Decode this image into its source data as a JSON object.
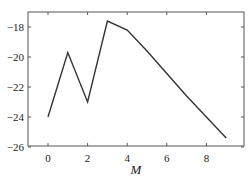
{
  "chart_data": {
    "type": "line",
    "title": "",
    "xlabel": "M",
    "ylabel": "",
    "x": [
      0,
      1,
      2,
      3,
      4,
      5,
      6,
      7,
      8,
      9
    ],
    "series": [
      {
        "name": "series-1",
        "color": "#333333",
        "values": [
          -24.0,
          -19.7,
          -23.0,
          -17.6,
          -18.2,
          -19.6,
          -21.1,
          -22.6,
          -24.0,
          -25.4
        ]
      }
    ],
    "xlim": [
      -1,
      10
    ],
    "ylim": [
      -26,
      -17.1
    ],
    "xticks": [
      0,
      2,
      4,
      6,
      8
    ],
    "xtick_labels": [
      "0",
      "2",
      "4",
      "6",
      "8"
    ],
    "yticks": [
      -18,
      -20,
      -22,
      -24,
      -26
    ],
    "ytick_labels": [
      "−18",
      "−20",
      "−22",
      "−24",
      "−26"
    ],
    "grid": false,
    "legend": null
  }
}
